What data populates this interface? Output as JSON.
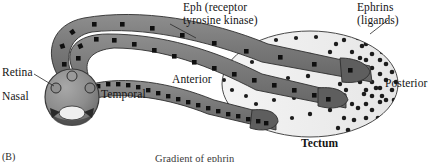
{
  "figure": {
    "panel_letter": "(B)",
    "caption_below": "Gradient of ephrin"
  },
  "labels": {
    "eph_receptor_line1": "Eph (receptor",
    "eph_receptor_line2": "tyrosine kinase)",
    "ephrins_line1": "Ephrins",
    "ephrins_line2": "(ligands)",
    "retina": "Retina",
    "nasal": "Nasal",
    "temporal": "Temporal",
    "anterior": "Anterior",
    "posterior": "Posterior",
    "tectum": "Tectum"
  },
  "colors": {
    "axon_fill": "#7d7d7d",
    "axon_fill_dark": "#6a6a6a",
    "receptor_square": "#111111",
    "eye_fill": "#8f8f8f",
    "eye_stroke": "#3a3a3a",
    "tectum_fill": "#efefef",
    "tectum_stroke": "#4a4a4a",
    "ephrin_dot": "#1c1c1c",
    "leader_line": "#2b2b2b",
    "text": "#141414"
  },
  "diagram": {
    "type": "biological-schematic",
    "eye": {
      "label": "retina",
      "center": [
        72,
        97
      ],
      "radius": 26,
      "ganglion_cell_bodies": 3,
      "axes": {
        "nasal_side": "left",
        "temporal_side": "right"
      }
    },
    "tectum": {
      "label": "Tectum",
      "center": [
        310,
        84
      ],
      "rx": 88,
      "ry": 53,
      "anterior_side": "left",
      "posterior_side": "right",
      "ephrin_gradient": "low anterior to high posterior"
    },
    "axons": [
      {
        "id": "nasal-axon",
        "origin": "nasal retina",
        "terminates": "posterior tectum",
        "receptor_density": "low"
      },
      {
        "id": "mid-axon",
        "origin": "central retina",
        "terminates": "mid tectum",
        "receptor_density": "medium"
      },
      {
        "id": "temporal-axon",
        "origin": "temporal retina",
        "terminates": "anterior tectum",
        "receptor_density": "high"
      }
    ],
    "legend_note": {
      "eph": "Eph (receptor tyrosine kinase) shown as black squares on axons",
      "ephrin": "Ephrins (ligands) shown as black dots in tectum"
    }
  }
}
